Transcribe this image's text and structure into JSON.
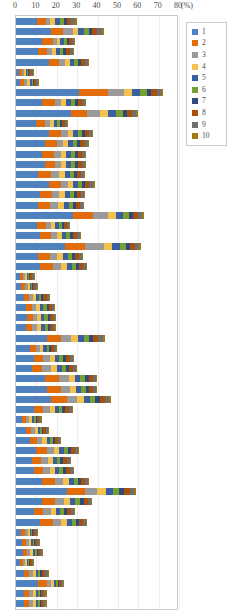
{
  "chart_data": {
    "type": "bar",
    "orientation": "horizontal",
    "stacked": true,
    "title": "",
    "xlabel": "(%)",
    "ylabel": "",
    "xlim": [
      0,
      80
    ],
    "xticks": [
      0,
      10,
      20,
      30,
      40,
      50,
      60,
      70,
      80
    ],
    "xtick_labels": [
      "0",
      "10",
      "20",
      "30",
      "40",
      "50",
      "60",
      "70",
      "80"
    ],
    "unit_label": "(%)",
    "grid": true,
    "legend_position": "right",
    "series": [
      {
        "name": "1",
        "color": "#4e81bd"
      },
      {
        "name": "2",
        "color": "#e36c0a"
      },
      {
        "name": "3",
        "color": "#9a9a9a"
      },
      {
        "name": "4",
        "color": "#f2c14e"
      },
      {
        "name": "5",
        "color": "#3a5fa0"
      },
      {
        "name": "6",
        "color": "#77a033"
      },
      {
        "name": "7",
        "color": "#2e4a7d"
      },
      {
        "name": "8",
        "color": "#a8500c"
      },
      {
        "name": "9",
        "color": "#6f6f6f"
      },
      {
        "name": "10",
        "color": "#9c7a1a"
      }
    ],
    "categories": [
      "r1",
      "r2",
      "r3",
      "r4",
      "r5",
      "r6",
      "r7",
      "r8",
      "r9",
      "r10",
      "r11",
      "r12",
      "r13",
      "r14",
      "r15",
      "r16",
      "r17",
      "r18",
      "r19",
      "r20",
      "r21",
      "r22",
      "r23",
      "r24",
      "r25",
      "r26",
      "r27",
      "r28",
      "r29",
      "r30",
      "r31",
      "r32",
      "r33",
      "r34",
      "r35",
      "r36",
      "r37",
      "r38",
      "r39",
      "r40",
      "r41",
      "r42",
      "r43",
      "r44",
      "r45",
      "r46",
      "r47",
      "r48",
      "r49",
      "r50",
      "r51",
      "r52",
      "r53",
      "r54",
      "r55",
      "r56"
    ],
    "values": [
      [
        10.5,
        4.0,
        2.0,
        2.5,
        2.5,
        2.0,
        1.5,
        2.0,
        2.0,
        1.0
      ],
      [
        17.0,
        6.0,
        5.0,
        2.5,
        3.0,
        2.5,
        1.5,
        2.5,
        2.0,
        1.0
      ],
      [
        13.0,
        5.0,
        2.0,
        1.5,
        2.0,
        1.5,
        1.0,
        1.5,
        1.0,
        0.5
      ],
      [
        11.0,
        4.0,
        2.5,
        2.0,
        2.0,
        1.5,
        1.5,
        2.0,
        1.5,
        0.5
      ],
      [
        16.0,
        5.0,
        3.0,
        2.5,
        2.0,
        2.0,
        1.5,
        2.0,
        1.5,
        0.5
      ],
      [
        1.5,
        1.5,
        1.0,
        1.0,
        0.5,
        0.5,
        0.5,
        1.0,
        1.0,
        0.5
      ],
      [
        2.0,
        2.0,
        1.5,
        1.5,
        1.0,
        0.5,
        0.5,
        1.0,
        1.0,
        0.5
      ],
      [
        31.0,
        14.0,
        8.0,
        4.0,
        4.0,
        3.5,
        2.0,
        2.5,
        2.0,
        1.0
      ],
      [
        13.0,
        6.0,
        3.0,
        2.5,
        2.5,
        2.0,
        1.5,
        2.0,
        1.5,
        0.5
      ],
      [
        27.0,
        8.0,
        6.0,
        4.0,
        4.0,
        3.5,
        2.0,
        2.5,
        2.0,
        1.0
      ],
      [
        10.0,
        4.0,
        2.5,
        2.0,
        1.5,
        1.5,
        1.0,
        1.5,
        1.0,
        0.5
      ],
      [
        16.0,
        6.0,
        3.5,
        2.5,
        2.5,
        2.0,
        1.5,
        2.0,
        1.5,
        0.5
      ],
      [
        14.0,
        6.0,
        3.0,
        2.5,
        2.5,
        2.0,
        1.5,
        2.0,
        1.5,
        1.0
      ],
      [
        13.0,
        5.5,
        3.5,
        2.5,
        2.5,
        2.0,
        1.5,
        2.0,
        1.5,
        0.5
      ],
      [
        14.0,
        5.0,
        3.0,
        2.5,
        2.5,
        2.0,
        1.5,
        2.0,
        1.5,
        0.5
      ],
      [
        11.0,
        6.0,
        4.0,
        3.0,
        2.5,
        2.0,
        1.5,
        2.0,
        1.5,
        0.5
      ],
      [
        16.0,
        6.0,
        3.5,
        2.5,
        2.5,
        2.0,
        1.5,
        2.0,
        2.0,
        1.0
      ],
      [
        12.0,
        5.5,
        3.5,
        3.0,
        2.5,
        2.0,
        1.5,
        2.0,
        1.5,
        0.5
      ],
      [
        11.0,
        5.5,
        4.0,
        3.0,
        2.5,
        2.0,
        1.5,
        2.0,
        1.5,
        0.5
      ],
      [
        28.0,
        10.0,
        7.0,
        4.0,
        3.5,
        3.0,
        2.0,
        2.5,
        2.0,
        1.0
      ],
      [
        10.5,
        4.0,
        2.5,
        2.0,
        2.0,
        1.5,
        1.0,
        1.5,
        1.0,
        0.5
      ],
      [
        12.0,
        5.0,
        3.0,
        2.5,
        2.0,
        2.0,
        1.5,
        2.0,
        1.5,
        0.5
      ],
      [
        24.0,
        10.0,
        9.0,
        4.0,
        4.0,
        3.0,
        2.0,
        2.5,
        2.0,
        1.0
      ],
      [
        11.0,
        5.5,
        3.5,
        3.0,
        2.5,
        2.0,
        1.5,
        2.0,
        1.5,
        0.5
      ],
      [
        12.0,
        6.0,
        4.0,
        3.0,
        2.5,
        2.0,
        1.5,
        2.0,
        1.5,
        0.5
      ],
      [
        2.0,
        1.5,
        1.0,
        1.0,
        0.5,
        0.5,
        0.5,
        1.0,
        1.0,
        0.5
      ],
      [
        2.5,
        2.0,
        1.5,
        1.0,
        0.5,
        0.5,
        0.5,
        1.0,
        1.0,
        0.5
      ],
      [
        4.0,
        2.5,
        2.0,
        1.5,
        1.5,
        1.0,
        1.0,
        1.5,
        1.0,
        0.5
      ],
      [
        5.0,
        3.0,
        2.0,
        2.0,
        1.5,
        1.5,
        1.0,
        1.5,
        1.0,
        0.5
      ],
      [
        5.5,
        3.0,
        2.0,
        2.0,
        1.5,
        1.5,
        1.0,
        1.5,
        1.0,
        0.5
      ],
      [
        5.0,
        3.0,
        2.5,
        2.0,
        1.5,
        1.5,
        1.0,
        1.5,
        1.0,
        0.5
      ],
      [
        15.0,
        7.0,
        5.0,
        3.5,
        3.0,
        2.5,
        2.0,
        2.5,
        2.0,
        1.0
      ],
      [
        7.0,
        3.0,
        2.0,
        1.5,
        1.5,
        1.0,
        1.0,
        1.5,
        1.0,
        0.5
      ],
      [
        9.0,
        4.5,
        3.0,
        2.5,
        2.0,
        2.0,
        1.5,
        2.0,
        1.5,
        0.5
      ],
      [
        8.0,
        5.0,
        4.0,
        3.0,
        2.5,
        2.0,
        1.5,
        2.0,
        1.5,
        0.5
      ],
      [
        14.0,
        7.0,
        5.0,
        3.0,
        2.5,
        2.5,
        2.0,
        2.0,
        1.5,
        0.5
      ],
      [
        15.0,
        7.0,
        4.5,
        3.0,
        2.5,
        2.5,
        1.5,
        2.0,
        1.5,
        0.5
      ],
      [
        17.0,
        8.0,
        5.0,
        3.5,
        3.0,
        2.5,
        2.0,
        2.5,
        2.0,
        1.0
      ],
      [
        9.0,
        4.5,
        3.0,
        2.5,
        2.0,
        1.5,
        1.5,
        2.0,
        1.5,
        0.5
      ],
      [
        3.0,
        2.0,
        1.5,
        1.5,
        1.0,
        1.0,
        0.5,
        1.0,
        1.0,
        0.5
      ],
      [
        5.0,
        2.5,
        2.0,
        1.5,
        1.0,
        1.0,
        0.5,
        1.0,
        1.0,
        0.5
      ],
      [
        7.0,
        3.5,
        2.5,
        2.0,
        1.5,
        1.5,
        1.0,
        1.5,
        1.0,
        0.5
      ],
      [
        10.0,
        5.0,
        3.5,
        2.5,
        2.5,
        2.0,
        1.5,
        2.0,
        1.5,
        0.5
      ],
      [
        8.0,
        4.5,
        3.0,
        2.5,
        2.0,
        1.5,
        1.5,
        2.0,
        1.5,
        0.5
      ],
      [
        9.0,
        4.5,
        3.0,
        2.5,
        2.0,
        2.0,
        1.5,
        2.0,
        1.5,
        0.5
      ],
      [
        13.0,
        6.0,
        4.0,
        3.0,
        2.5,
        2.0,
        1.5,
        2.0,
        1.5,
        0.5
      ],
      [
        25.0,
        9.0,
        6.0,
        4.0,
        3.5,
        3.0,
        2.5,
        3.0,
        2.0,
        1.0
      ],
      [
        13.0,
        6.0,
        4.5,
        3.0,
        2.5,
        2.5,
        2.0,
        2.0,
        1.5,
        0.5
      ],
      [
        9.0,
        4.5,
        3.5,
        2.5,
        2.0,
        2.0,
        1.5,
        2.0,
        1.5,
        0.5
      ],
      [
        12.0,
        6.0,
        4.0,
        3.0,
        2.5,
        2.0,
        1.5,
        2.0,
        1.5,
        0.5
      ],
      [
        2.5,
        2.0,
        1.5,
        1.0,
        0.5,
        0.5,
        0.5,
        1.0,
        1.0,
        0.5
      ],
      [
        3.0,
        2.0,
        1.5,
        1.0,
        1.0,
        0.5,
        0.5,
        1.0,
        1.0,
        0.5
      ],
      [
        3.5,
        2.0,
        1.5,
        1.5,
        1.0,
        1.0,
        0.5,
        1.0,
        1.0,
        0.5
      ],
      [
        2.0,
        1.5,
        1.0,
        1.0,
        0.5,
        0.5,
        0.5,
        1.0,
        0.5,
        0.5
      ],
      [
        4.0,
        2.5,
        2.0,
        1.5,
        1.0,
        1.0,
        1.0,
        1.5,
        1.0,
        0.5
      ],
      [
        11.0,
        4.0,
        2.0,
        1.5,
        1.0,
        1.0,
        0.5,
        1.0,
        1.0,
        0.5
      ]
    ],
    "extra_rows": [
      [
        4.0,
        2.5,
        2.0,
        1.5,
        1.0,
        1.0,
        0.5,
        1.0,
        1.0,
        0.5
      ],
      [
        4.0,
        2.5,
        2.0,
        1.5,
        1.0,
        1.0,
        0.5,
        1.0,
        1.0,
        0.5
      ]
    ]
  },
  "legend": {
    "items": [
      {
        "label": "1"
      },
      {
        "label": "2"
      },
      {
        "label": "3"
      },
      {
        "label": "4"
      },
      {
        "label": "5"
      },
      {
        "label": "6"
      },
      {
        "label": "7"
      },
      {
        "label": "8"
      },
      {
        "label": "9"
      },
      {
        "label": "10"
      }
    ]
  }
}
